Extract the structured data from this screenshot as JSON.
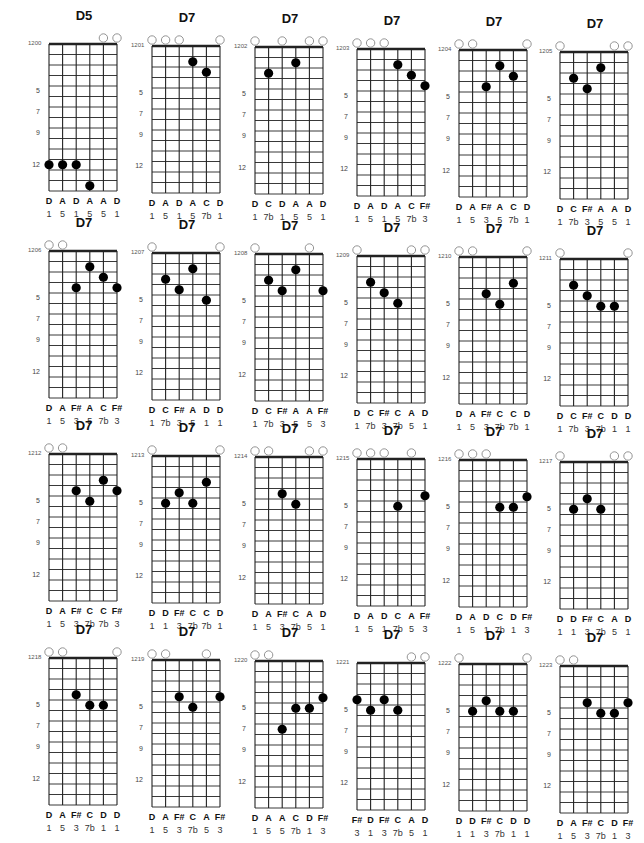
{
  "tuning": [
    "D",
    "A",
    "D",
    "G",
    "A",
    "D"
  ],
  "fret_markers": [
    5,
    7,
    9,
    12
  ],
  "num_frets": 14,
  "charts": [
    {
      "id": "1200",
      "name": "D5",
      "frets": [
        12,
        12,
        12,
        14,
        0,
        0
      ],
      "notes": [
        "D",
        "A",
        "D",
        "A",
        "A",
        "D"
      ],
      "intervals": [
        "1",
        "5",
        "1",
        "5",
        "5",
        "1"
      ]
    },
    {
      "id": "1201",
      "name": "D7",
      "frets": [
        0,
        0,
        0,
        2,
        3,
        0
      ],
      "notes": [
        "D",
        "A",
        "D",
        "A",
        "C",
        "D"
      ],
      "intervals": [
        "1",
        "5",
        "1",
        "5",
        "7b",
        "1"
      ]
    },
    {
      "id": "1202",
      "name": "D7",
      "frets": [
        0,
        3,
        0,
        2,
        0,
        0
      ],
      "notes": [
        "D",
        "C",
        "D",
        "A",
        "A",
        "D"
      ],
      "intervals": [
        "1",
        "7b",
        "1",
        "5",
        "5",
        "1"
      ]
    },
    {
      "id": "1203",
      "name": "D7",
      "frets": [
        0,
        0,
        0,
        2,
        3,
        4
      ],
      "notes": [
        "D",
        "A",
        "D",
        "A",
        "C",
        "F#"
      ],
      "intervals": [
        "1",
        "5",
        "1",
        "5",
        "7b",
        "3"
      ]
    },
    {
      "id": "1204",
      "name": "D7",
      "frets": [
        0,
        0,
        4,
        2,
        3,
        0
      ],
      "notes": [
        "D",
        "A",
        "F#",
        "A",
        "C",
        "D"
      ],
      "intervals": [
        "1",
        "5",
        "3",
        "5",
        "7b",
        "1"
      ]
    },
    {
      "id": "1205",
      "name": "D7",
      "frets": [
        0,
        3,
        4,
        2,
        0,
        0
      ],
      "notes": [
        "D",
        "C",
        "F#",
        "A",
        "A",
        "D"
      ],
      "intervals": [
        "1",
        "7b",
        "3",
        "5",
        "5",
        "1"
      ]
    },
    {
      "id": "1206",
      "name": "D7",
      "frets": [
        0,
        0,
        4,
        2,
        3,
        4
      ],
      "notes": [
        "D",
        "A",
        "F#",
        "A",
        "C",
        "F#"
      ],
      "intervals": [
        "1",
        "5",
        "3",
        "5",
        "7b",
        "3"
      ]
    },
    {
      "id": "1207",
      "name": "D7",
      "frets": [
        0,
        3,
        4,
        2,
        5,
        0
      ],
      "notes": [
        "D",
        "C",
        "F#",
        "A",
        "D",
        "D"
      ],
      "intervals": [
        "1",
        "7b",
        "3",
        "5",
        "1",
        "1"
      ]
    },
    {
      "id": "1208",
      "name": "D7",
      "frets": [
        0,
        3,
        4,
        2,
        0,
        4
      ],
      "notes": [
        "D",
        "C",
        "F#",
        "A",
        "A",
        "F#"
      ],
      "intervals": [
        "1",
        "7b",
        "3",
        "5",
        "5",
        "3"
      ]
    },
    {
      "id": "1209",
      "name": "D7",
      "frets": [
        0,
        3,
        4,
        5,
        0,
        0
      ],
      "notes": [
        "D",
        "C",
        "F#",
        "C",
        "A",
        "D"
      ],
      "intervals": [
        "1",
        "7b",
        "3",
        "7b",
        "5",
        "1"
      ]
    },
    {
      "id": "1210",
      "name": "D7",
      "frets": [
        0,
        0,
        4,
        5,
        3,
        0
      ],
      "notes": [
        "D",
        "A",
        "F#",
        "C",
        "C",
        "D"
      ],
      "intervals": [
        "1",
        "5",
        "3",
        "7b",
        "7b",
        "1"
      ]
    },
    {
      "id": "1211",
      "name": "D7",
      "frets": [
        0,
        3,
        4,
        5,
        5,
        0
      ],
      "notes": [
        "D",
        "C",
        "F#",
        "C",
        "D",
        "D"
      ],
      "intervals": [
        "1",
        "7b",
        "3",
        "7b",
        "1",
        "1"
      ]
    },
    {
      "id": "1212",
      "name": "D7",
      "frets": [
        0,
        0,
        4,
        5,
        3,
        4
      ],
      "notes": [
        "D",
        "A",
        "F#",
        "C",
        "C",
        "F#"
      ],
      "intervals": [
        "1",
        "5",
        "3",
        "7b",
        "7b",
        "3"
      ]
    },
    {
      "id": "1213",
      "name": "D7",
      "frets": [
        0,
        5,
        4,
        5,
        3,
        0
      ],
      "notes": [
        "D",
        "D",
        "F#",
        "C",
        "C",
        "D"
      ],
      "intervals": [
        "1",
        "1",
        "3",
        "7b",
        "7b",
        "1"
      ]
    },
    {
      "id": "1214",
      "name": "D7",
      "frets": [
        0,
        0,
        4,
        5,
        0,
        0
      ],
      "notes": [
        "D",
        "A",
        "F#",
        "C",
        "A",
        "D"
      ],
      "intervals": [
        "1",
        "5",
        "3",
        "7b",
        "5",
        "1"
      ]
    },
    {
      "id": "1215",
      "name": "D7",
      "frets": [
        0,
        0,
        0,
        5,
        0,
        4
      ],
      "notes": [
        "D",
        "A",
        "D",
        "C",
        "A",
        "F#"
      ],
      "intervals": [
        "1",
        "5",
        "1",
        "7b",
        "5",
        "3"
      ]
    },
    {
      "id": "1216",
      "name": "D7",
      "frets": [
        0,
        0,
        0,
        5,
        5,
        4
      ],
      "notes": [
        "D",
        "A",
        "D",
        "C",
        "D",
        "F#"
      ],
      "intervals": [
        "1",
        "5",
        "1",
        "7b",
        "1",
        "3"
      ]
    },
    {
      "id": "1217",
      "name": "D7",
      "frets": [
        0,
        5,
        4,
        5,
        0,
        0
      ],
      "notes": [
        "D",
        "D",
        "F#",
        "C",
        "A",
        "D"
      ],
      "intervals": [
        "1",
        "1",
        "3",
        "7b",
        "5",
        "1"
      ]
    },
    {
      "id": "1218",
      "name": "D7",
      "frets": [
        0,
        0,
        4,
        5,
        5,
        0
      ],
      "notes": [
        "D",
        "A",
        "F#",
        "C",
        "D",
        "D"
      ],
      "intervals": [
        "1",
        "5",
        "3",
        "7b",
        "1",
        "1"
      ]
    },
    {
      "id": "1219",
      "name": "D7",
      "frets": [
        0,
        0,
        4,
        5,
        0,
        4
      ],
      "notes": [
        "D",
        "A",
        "F#",
        "C",
        "A",
        "F#"
      ],
      "intervals": [
        "1",
        "5",
        "3",
        "7b",
        "5",
        "3"
      ]
    },
    {
      "id": "1220",
      "name": "D7",
      "frets": [
        0,
        0,
        7,
        5,
        5,
        4
      ],
      "notes": [
        "D",
        "A",
        "A",
        "C",
        "D",
        "F#"
      ],
      "intervals": [
        "1",
        "5",
        "5",
        "7b",
        "1",
        "3"
      ]
    },
    {
      "id": "1221",
      "name": "D7",
      "frets": [
        4,
        5,
        4,
        5,
        0,
        0
      ],
      "notes": [
        "F#",
        "D",
        "F#",
        "C",
        "A",
        "D"
      ],
      "intervals": [
        "3",
        "1",
        "3",
        "7b",
        "5",
        "1"
      ]
    },
    {
      "id": "1222",
      "name": "D7",
      "frets": [
        0,
        5,
        4,
        5,
        5,
        0
      ],
      "notes": [
        "D",
        "D",
        "F#",
        "C",
        "D",
        "D"
      ],
      "intervals": [
        "1",
        "1",
        "3",
        "7b",
        "1",
        "1"
      ]
    },
    {
      "id": "1223",
      "name": "D7",
      "frets": [
        0,
        0,
        4,
        5,
        5,
        4
      ],
      "notes": [
        "D",
        "A",
        "F#",
        "C",
        "D",
        "F#"
      ],
      "intervals": [
        "1",
        "5",
        "3",
        "7b",
        "1",
        "3"
      ]
    }
  ]
}
